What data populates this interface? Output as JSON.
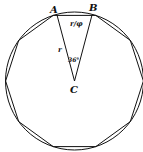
{
  "diagram": {
    "points": {
      "A": {
        "label": "A",
        "x": 57,
        "y": 13
      },
      "B": {
        "label": "B",
        "x": 92,
        "y": 13
      },
      "C": {
        "label": "C",
        "x": 74,
        "y": 80
      }
    },
    "labels": {
      "side": "r",
      "chord": "r/φ",
      "angle": "36°"
    },
    "polygon_sides": 10,
    "colors": {
      "stroke": "#111111",
      "background": "#ffffff"
    }
  }
}
